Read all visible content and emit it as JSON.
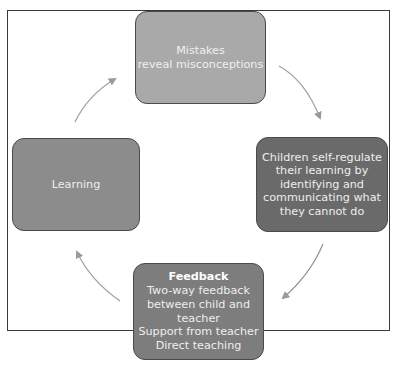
{
  "diagram": {
    "type": "cycle",
    "nodes": {
      "top": {
        "lines": [
          "Mistakes",
          "reveal misconceptions"
        ]
      },
      "right": {
        "lines": [
          "Children self-regulate",
          "their learning by",
          "identifying and",
          "communicating what",
          "they cannot do"
        ]
      },
      "bottom": {
        "title": "Feedback",
        "lines": [
          "Two-way feedback",
          "between child and",
          "teacher",
          "Support from teacher",
          "Direct teaching"
        ]
      },
      "left": {
        "lines": [
          "Learning"
        ]
      }
    },
    "edges": [
      {
        "from": "top",
        "to": "right"
      },
      {
        "from": "right",
        "to": "bottom"
      },
      {
        "from": "bottom",
        "to": "left"
      },
      {
        "from": "left",
        "to": "top"
      }
    ],
    "colors": {
      "top": "#a9a9a9",
      "right": "#6a6a6a",
      "bottom": "#7d7d7d",
      "left": "#8c8c8c",
      "arrow": "#9a9a9a",
      "frame": "#3a3a3a"
    }
  }
}
